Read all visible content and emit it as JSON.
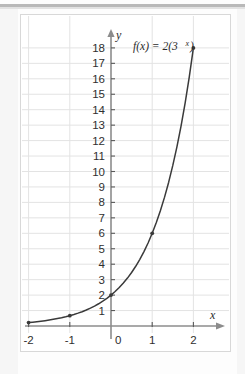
{
  "figure": {
    "frame_border_color": "#d8d8d8",
    "background": "#ffffff",
    "top_rule_color": "#b9b9b9"
  },
  "chart_data": {
    "type": "line",
    "title": "",
    "subtitle": "",
    "function_label": "f(x) = 2(3",
    "function_label_exponent": "x",
    "function_label_tail": ")",
    "expression": "f(x) = 2(3^x)",
    "xlabel": "x",
    "ylabel": "y",
    "xlim": [
      -2.35,
      2.45
    ],
    "ylim": [
      -1.1,
      19.2
    ],
    "grid": true,
    "grid_color": "#e3e3e3",
    "axis_color": "#8c8c8c",
    "curve_color": "#3a3a3a",
    "legend": "none",
    "x_ticks": [
      -2,
      -1,
      0,
      1,
      2
    ],
    "x_tick_labels": [
      "-2",
      "-1",
      "0",
      "1",
      "2"
    ],
    "y_ticks": [
      1,
      2,
      3,
      4,
      5,
      6,
      7,
      8,
      9,
      10,
      11,
      12,
      13,
      14,
      15,
      16,
      17,
      18
    ],
    "y_tick_labels": [
      "1",
      "2",
      "3",
      "4",
      "5",
      "6",
      "7",
      "8",
      "9",
      "10",
      "11",
      "12",
      "13",
      "14",
      "15",
      "16",
      "17",
      "18"
    ],
    "marked_points": [
      {
        "x": -2,
        "y": 0.222
      },
      {
        "x": -1,
        "y": 0.667
      },
      {
        "x": 0,
        "y": 2
      },
      {
        "x": 1,
        "y": 6
      },
      {
        "x": 2,
        "y": 18
      }
    ],
    "x": [
      -2,
      -1.9,
      -1.8,
      -1.7,
      -1.6,
      -1.5,
      -1.4,
      -1.3,
      -1.2,
      -1.1,
      -1,
      -0.9,
      -0.8,
      -0.7,
      -0.6,
      -0.5,
      -0.4,
      -0.3,
      -0.2,
      -0.1,
      0,
      0.1,
      0.2,
      0.3,
      0.4,
      0.5,
      0.6,
      0.7,
      0.8,
      0.9,
      1,
      1.1,
      1.2,
      1.3,
      1.4,
      1.5,
      1.6,
      1.7,
      1.8,
      1.9,
      2
    ],
    "values": [
      0.222,
      0.248,
      0.277,
      0.309,
      0.345,
      0.385,
      0.43,
      0.48,
      0.536,
      0.598,
      0.667,
      0.744,
      0.831,
      0.927,
      1.035,
      1.155,
      1.289,
      1.439,
      1.606,
      1.792,
      2,
      2.232,
      2.491,
      2.78,
      3.102,
      3.464,
      3.866,
      4.314,
      4.815,
      5.374,
      6,
      6.696,
      7.473,
      8.341,
      9.309,
      10.392,
      11.598,
      12.943,
      14.445,
      16.122,
      18
    ]
  }
}
